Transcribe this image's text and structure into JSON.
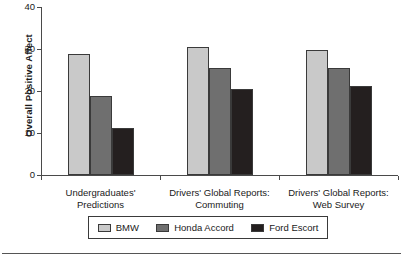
{
  "chart_data": {
    "type": "bar",
    "title": "",
    "subtitle": "",
    "xlabel": "",
    "ylabel": "Overall Positive Affect",
    "ylim": [
      0,
      40
    ],
    "yticks": [
      0,
      10,
      20,
      30,
      40
    ],
    "ytick_labels": [
      "0",
      "10",
      "20",
      "30",
      "40"
    ],
    "grid": false,
    "legend_position": "bottom",
    "categories": [
      "Undergraduates'\nPredictions",
      "Drivers' Global Reports:\nCommuting",
      "Drivers' Global Reports:\nWeb Survey"
    ],
    "series": [
      {
        "name": "BMW",
        "color": "#c9c9c9",
        "values": [
          28.8,
          30.4,
          29.8
        ]
      },
      {
        "name": "Honda Accord",
        "color": "#6f6f6f",
        "values": [
          18.7,
          25.4,
          25.4
        ]
      },
      {
        "name": "Ford Escort",
        "color": "#241f1f",
        "values": [
          11.2,
          20.5,
          21.2
        ]
      }
    ]
  },
  "legend": {
    "items": [
      {
        "label": "BMW"
      },
      {
        "label": "Honda Accord"
      },
      {
        "label": "Ford Escort"
      }
    ]
  }
}
